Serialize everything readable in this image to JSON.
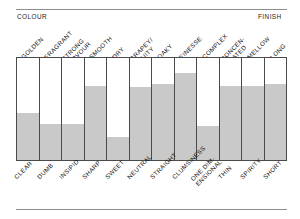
{
  "header": {
    "left_caption": "COLOUR",
    "right_caption": "FINISH"
  },
  "colors": {
    "fill": "#c9c9c9",
    "grid_line": "#4a4a4a",
    "rule": "#8e8e8e",
    "text": "#111111",
    "background": "#ffffff"
  },
  "chart_data": {
    "type": "bar",
    "title": "",
    "subtitle": "",
    "xlabel": "",
    "ylabel": "",
    "ylim": [
      0,
      100
    ],
    "grid": false,
    "legend": "none",
    "orientation": "vertical",
    "note": "Each column is a bipolar tasting scale: the top label is the positive pole, the bottom label the negative pole. The grey fill height is the rating on that scale.",
    "categories": [
      "GOLDEN",
      "FRAGRANT",
      "STRONG\nFLAVOUR",
      "SMOOTH",
      "DRY",
      "GRAPEY/\nFRUITY",
      "OAKY",
      "FINESSE",
      "COMPLEX",
      "CONCEN-\nTRATED",
      "MELLOW",
      "LONG"
    ],
    "categories_bottom": [
      "CLEAR",
      "DUMB",
      "INSIPID",
      "SHARP",
      "SWEET",
      "NEUTRAL",
      "STRAIGHT",
      "CLUMSINESS",
      "ONE DIM-\nENSIONAL",
      "THIN",
      "SPIRITY",
      "SHORT"
    ],
    "values": [
      46,
      35,
      35,
      73,
      23,
      72,
      75,
      85,
      33,
      73,
      73,
      75
    ],
    "columns": [
      {
        "top_label": "GOLDEN",
        "bottom_label": "CLEAR",
        "value": 46
      },
      {
        "top_label": "FRAGRANT",
        "bottom_label": "DUMB",
        "value": 35
      },
      {
        "top_label": "STRONG\nFLAVOUR",
        "bottom_label": "INSIPID",
        "value": 35
      },
      {
        "top_label": "SMOOTH",
        "bottom_label": "SHARP",
        "value": 73
      },
      {
        "top_label": "DRY",
        "bottom_label": "SWEET",
        "value": 23
      },
      {
        "top_label": "GRAPEY/\nFRUITY",
        "bottom_label": "NEUTRAL",
        "value": 72
      },
      {
        "top_label": "OAKY",
        "bottom_label": "STRAIGHT",
        "value": 75
      },
      {
        "top_label": "FINESSE",
        "bottom_label": "CLUMSINESS",
        "value": 85
      },
      {
        "top_label": "COMPLEX",
        "bottom_label": "ONE DIM-\nENSIONAL",
        "value": 33
      },
      {
        "top_label": "CONCEN-\nTRATED",
        "bottom_label": "THIN",
        "value": 73
      },
      {
        "top_label": "MELLOW",
        "bottom_label": "SPIRITY",
        "value": 73
      },
      {
        "top_label": "LONG",
        "bottom_label": "SHORT",
        "value": 75
      }
    ]
  }
}
